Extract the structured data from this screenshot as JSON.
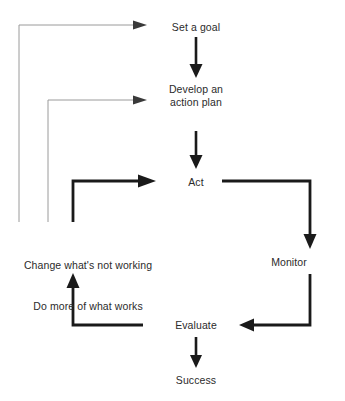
{
  "diagram": {
    "type": "flowchart",
    "colors": {
      "background": "#ffffff",
      "text": "#2b2b2b",
      "thick_line": "#1a1a1a",
      "thin_line": "#9a9a9a"
    },
    "nodes": [
      {
        "id": "set-a-goal",
        "label": "Set a goal",
        "x": 196,
        "y": 27
      },
      {
        "id": "develop-an-action-plan",
        "label": "Develop an\naction plan",
        "x": 196,
        "y": 95
      },
      {
        "id": "act",
        "label": "Act",
        "x": 196,
        "y": 182
      },
      {
        "id": "monitor",
        "label": "Monitor",
        "x": 289,
        "y": 262
      },
      {
        "id": "evaluate",
        "label": "Evaluate",
        "x": 196,
        "y": 326
      },
      {
        "id": "success",
        "label": "Success",
        "x": 196,
        "y": 381
      }
    ],
    "annotations": [
      {
        "id": "change-note",
        "line1": "Change what's not working",
        "line2": "Do more of what works",
        "x": 88,
        "y": 232
      }
    ],
    "edges": [
      {
        "id": "goal-to-plan",
        "from": "set-a-goal",
        "to": "develop-an-action-plan",
        "style": "thick",
        "shape": "vertical"
      },
      {
        "id": "plan-to-act",
        "from": "develop-an-action-plan",
        "to": "act",
        "style": "thick",
        "shape": "vertical"
      },
      {
        "id": "act-to-monitor",
        "from": "act",
        "to": "monitor",
        "style": "thick",
        "shape": "elbow-right-down"
      },
      {
        "id": "monitor-to-evaluate",
        "from": "monitor",
        "to": "evaluate",
        "style": "thick",
        "shape": "elbow-down-left"
      },
      {
        "id": "evaluate-to-success",
        "from": "evaluate",
        "to": "success",
        "style": "thick",
        "shape": "vertical"
      },
      {
        "id": "evaluate-to-change-note",
        "from": "evaluate",
        "to": "change-note",
        "style": "thick",
        "shape": "elbow-left-up"
      },
      {
        "id": "change-note-to-act",
        "from": "change-note",
        "to": "act",
        "style": "thick",
        "shape": "elbow-up-right"
      },
      {
        "id": "feedback-to-plan",
        "from": "change-note",
        "to": "develop-an-action-plan",
        "style": "thin",
        "shape": "elbow-up-right"
      },
      {
        "id": "feedback-to-goal",
        "from": "change-note",
        "to": "set-a-goal",
        "style": "thin",
        "shape": "elbow-up-right"
      }
    ]
  }
}
